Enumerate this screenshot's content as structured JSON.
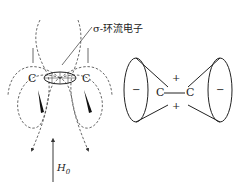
{
  "left_diagram": {
    "ring_label": "σ-环流电子",
    "atom_left": "C",
    "atom_right": "C",
    "field_label": "H",
    "field_subscript": "0"
  },
  "right_diagram": {
    "atom_left": "C",
    "atom_right": "C",
    "bond": "—",
    "cone_left_sign": "−",
    "cone_right_sign": "−",
    "top_sign": "+",
    "bottom_sign": "+"
  }
}
